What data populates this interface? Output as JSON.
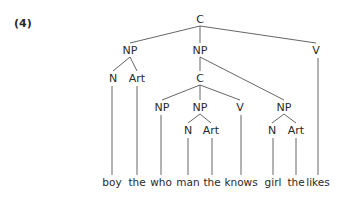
{
  "example_label": "(4)",
  "nodes": [
    {
      "id": "root",
      "label": "C",
      "x": 200,
      "y": 23
    },
    {
      "id": "np1",
      "label": "NP",
      "x": 130,
      "y": 54
    },
    {
      "id": "np2",
      "label": "NP",
      "x": 200,
      "y": 54
    },
    {
      "id": "v1",
      "label": "V",
      "x": 316,
      "y": 54
    },
    {
      "id": "n1",
      "label": "N",
      "x": 113,
      "y": 82
    },
    {
      "id": "art1",
      "label": "Art",
      "x": 137,
      "y": 82
    },
    {
      "id": "c2",
      "label": "C",
      "x": 200,
      "y": 82
    },
    {
      "id": "np3",
      "label": "NP",
      "x": 162,
      "y": 111
    },
    {
      "id": "np4",
      "label": "NP",
      "x": 200,
      "y": 111
    },
    {
      "id": "v2",
      "label": "V",
      "x": 240,
      "y": 111
    },
    {
      "id": "np5",
      "label": "NP",
      "x": 284,
      "y": 111
    },
    {
      "id": "n2",
      "label": "N",
      "x": 188,
      "y": 134
    },
    {
      "id": "art2",
      "label": "Art",
      "x": 211,
      "y": 134
    },
    {
      "id": "n3",
      "label": "N",
      "x": 272,
      "y": 134
    },
    {
      "id": "art3",
      "label": "Art",
      "x": 296,
      "y": 134
    }
  ],
  "words": [
    {
      "text": "boy",
      "x": 112
    },
    {
      "text": "the",
      "x": 137
    },
    {
      "text": "who",
      "x": 161
    },
    {
      "text": "man",
      "x": 188
    },
    {
      "text": "the",
      "x": 212
    },
    {
      "text": "knows",
      "x": 241
    },
    {
      "text": "girl",
      "x": 273
    },
    {
      "text": "the",
      "x": 296
    },
    {
      "text": "likes",
      "x": 318
    }
  ],
  "words_y": 186,
  "edges": [
    [
      "root",
      "np1"
    ],
    [
      "root",
      "np2"
    ],
    [
      "root",
      "v1"
    ],
    [
      "np1",
      "n1"
    ],
    [
      "np1",
      "art1"
    ],
    [
      "np2",
      "c2"
    ],
    [
      "np2",
      "np5"
    ],
    [
      "c2",
      "np3"
    ],
    [
      "c2",
      "np4"
    ],
    [
      "c2",
      "v2"
    ],
    [
      "np4",
      "n2"
    ],
    [
      "np4",
      "art2"
    ],
    [
      "np5",
      "n3"
    ],
    [
      "np5",
      "art3"
    ]
  ],
  "leaf_links": [
    {
      "from": "n1",
      "word": 0
    },
    {
      "from": "art1",
      "word": 1
    },
    {
      "from": "np3",
      "word": 2
    },
    {
      "from": "n2",
      "word": 3
    },
    {
      "from": "art2",
      "word": 4
    },
    {
      "from": "v2",
      "word": 5
    },
    {
      "from": "n3",
      "word": 6
    },
    {
      "from": "art3",
      "word": 7
    },
    {
      "from": "v1",
      "word": 8
    }
  ]
}
